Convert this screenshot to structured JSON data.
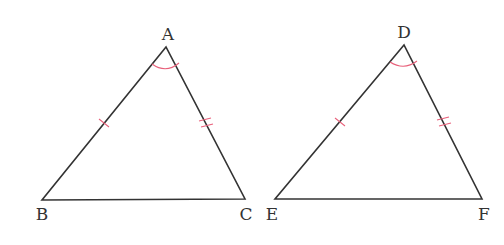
{
  "diagram": {
    "type": "geometry-congruent-triangles",
    "colors": {
      "edge": "#333333",
      "mark": "#e8607a",
      "label": "#333333",
      "background": "#ffffff"
    },
    "triangles": [
      {
        "name": "ABC",
        "vertices": [
          {
            "label": "A",
            "x": 166,
            "y": 47,
            "lx": 168,
            "ly": 40
          },
          {
            "label": "B",
            "x": 42,
            "y": 200,
            "lx": 42,
            "ly": 220
          },
          {
            "label": "C",
            "x": 245,
            "y": 199,
            "lx": 246,
            "ly": 220
          }
        ],
        "marks": {
          "angle_at": "A",
          "side_AB": "single-tick",
          "side_AC": "double-tick"
        }
      },
      {
        "name": "DEF",
        "vertices": [
          {
            "label": "D",
            "x": 404,
            "y": 45,
            "lx": 404,
            "ly": 38
          },
          {
            "label": "E",
            "x": 275,
            "y": 199,
            "lx": 272,
            "ly": 220
          },
          {
            "label": "F",
            "x": 482,
            "y": 199,
            "lx": 484,
            "ly": 220
          }
        ],
        "marks": {
          "angle_at": "D",
          "side_DE": "single-tick",
          "side_DF": "double-tick"
        }
      }
    ]
  }
}
